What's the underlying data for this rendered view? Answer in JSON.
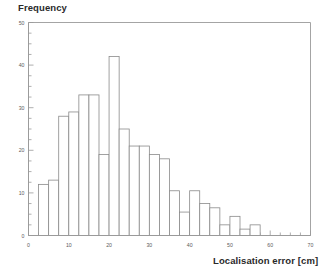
{
  "chart_data": {
    "type": "bar",
    "title": "Frequency",
    "subtitle": "",
    "xlabel": "Localisation error [cm]",
    "ylabel": "Frequency",
    "xlim": [
      0,
      70
    ],
    "ylim": [
      0,
      50
    ],
    "grid": false,
    "legend": null,
    "legend_position": "none",
    "bin_width": 2.5,
    "x_major_ticks": [
      0,
      10,
      20,
      30,
      40,
      50,
      60,
      70
    ],
    "x_major_tick_labels": [
      "0",
      "10",
      "20",
      "30",
      "40",
      "50",
      "60",
      "70"
    ],
    "x_minor_tick_step": 2.5,
    "y_major_ticks": [
      0,
      10,
      20,
      30,
      40,
      50
    ],
    "y_major_tick_labels": [
      "0",
      "10",
      "20",
      "30",
      "40",
      "50"
    ],
    "y_minor_tick_step": 2.5,
    "bin_edges": [
      2.5,
      5,
      7.5,
      10,
      12.5,
      15,
      17.5,
      20,
      22.5,
      25,
      27.5,
      30,
      32.5,
      35,
      37.5,
      40,
      42.5,
      45,
      47.5,
      50,
      52.5,
      55,
      57.5,
      60
    ],
    "categories": [
      "2.5-5",
      "5-7.5",
      "7.5-10",
      "10-12.5",
      "12.5-15",
      "15-17.5",
      "17.5-20",
      "20-22.5",
      "22.5-25",
      "25-27.5",
      "27.5-30",
      "30-32.5",
      "32.5-35",
      "35-37.5",
      "37.5-40",
      "40-42.5",
      "42.5-45",
      "45-47.5",
      "47.5-50",
      "50-52.5",
      "52.5-55",
      "55-57.5",
      "57.5-60"
    ],
    "values": [
      12,
      13,
      28,
      29,
      33,
      33,
      19,
      42,
      25,
      21,
      21,
      19,
      18,
      18,
      5.5,
      10.5,
      7.5,
      6.5,
      6.5,
      2.5,
      4.5,
      1.5,
      2.5
    ],
    "bars": [
      {
        "x0": 2.5,
        "x1": 5,
        "value": 12
      },
      {
        "x0": 5,
        "x1": 7.5,
        "value": 13
      },
      {
        "x0": 7.5,
        "x1": 10,
        "value": 28
      },
      {
        "x0": 10,
        "x1": 12.5,
        "value": 29
      },
      {
        "x0": 12.5,
        "x1": 15,
        "value": 33
      },
      {
        "x0": 15,
        "x1": 17.5,
        "value": 33
      },
      {
        "x0": 17.5,
        "x1": 20,
        "value": 19
      },
      {
        "x0": 20,
        "x1": 22.5,
        "value": 42
      },
      {
        "x0": 22.5,
        "x1": 25,
        "value": 25
      },
      {
        "x0": 25,
        "x1": 27.5,
        "value": 21
      },
      {
        "x0": 27.5,
        "x1": 30,
        "value": 21
      },
      {
        "x0": 30,
        "x1": 32.5,
        "value": 19
      },
      {
        "x0": 32.5,
        "x1": 35,
        "value": 18
      },
      {
        "x0": 35,
        "x1": 37.5,
        "value": 10.5
      },
      {
        "x0": 37.5,
        "x1": 40,
        "value": 5.5
      },
      {
        "x0": 40,
        "x1": 42.5,
        "value": 10.5
      },
      {
        "x0": 42.5,
        "x1": 45,
        "value": 7.5
      },
      {
        "x0": 45,
        "x1": 47.5,
        "value": 6.5
      },
      {
        "x0": 47.5,
        "x1": 50,
        "value": 2.5
      },
      {
        "x0": 50,
        "x1": 52.5,
        "value": 4.5
      },
      {
        "x0": 52.5,
        "x1": 55,
        "value": 1.5
      },
      {
        "x0": 55,
        "x1": 57.5,
        "value": 2.5
      },
      {
        "x0": 57.5,
        "x1": 60,
        "value": 0
      }
    ],
    "bar_fill": "#ffffff",
    "bar_stroke": "#8a8a8a",
    "axis_color": "#9a9a9a",
    "text_color": "#2a2a2a"
  }
}
